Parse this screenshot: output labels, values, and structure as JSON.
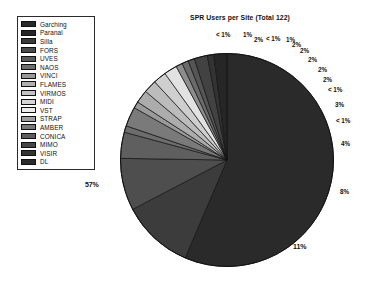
{
  "chart_data": {
    "type": "pie",
    "title": "SPR Users per Site (Total 122)",
    "total": 122,
    "legend_position": "left",
    "grid": false,
    "categories": [
      "Garching",
      "Paranal",
      "Silla",
      "FORS",
      "UVES",
      "NAOS",
      "VINCI",
      "FLAMES",
      "VIRMOS",
      "MIDI",
      "VST",
      "STRAP",
      "AMBER",
      "CONICA",
      "MIMO",
      "VISIR",
      "DL"
    ],
    "values": [
      57,
      11,
      8,
      4,
      1,
      3,
      2,
      2,
      2,
      2,
      1,
      1,
      2,
      2,
      1,
      1,
      1
    ],
    "labels": [
      "57%",
      "11%",
      "8%",
      "4%",
      "< 1%",
      "3%",
      "< 1%",
      "2%",
      "2%",
      "2%",
      "2%",
      "< 1%",
      "1%",
      "< 1%",
      "2%",
      "1%",
      "2%"
    ],
    "colors": [
      "#2a2a2a",
      "#3c3c3c",
      "#4e4e4e",
      "#5f5f5f",
      "#6d6d6d",
      "#7a7a7a",
      "#9a9a9a",
      "#acacac",
      "#bcbcbc",
      "#cfcfcf",
      "#e2e2e2",
      "#8d8d8d",
      "#6a6a6a",
      "#555555",
      "#424242",
      "#333333",
      "#262626"
    ],
    "slices": [
      {
        "name": "Garching",
        "label": "57%",
        "value": 57,
        "color": "#2a2a2a"
      },
      {
        "name": "Paranal",
        "label": "11%",
        "value": 11,
        "color": "#3c3c3c"
      },
      {
        "name": "Silla",
        "label": "8%",
        "value": 8,
        "color": "#4e4e4e"
      },
      {
        "name": "FORS",
        "label": "4%",
        "value": 4,
        "color": "#5f5f5f"
      },
      {
        "name": "UVES",
        "label": "< 1%",
        "value": 1,
        "color": "#6d6d6d"
      },
      {
        "name": "NAOS",
        "label": "3%",
        "value": 3,
        "color": "#7a7a7a"
      },
      {
        "name": "VINCI",
        "label": "< 1%",
        "value": 1,
        "color": "#9a9a9a"
      },
      {
        "name": "FLAMES",
        "label": "2%",
        "value": 2,
        "color": "#acacac"
      },
      {
        "name": "VIRMOS",
        "label": "2%",
        "value": 2,
        "color": "#bcbcbc"
      },
      {
        "name": "MIDI",
        "label": "2%",
        "value": 2,
        "color": "#cfcfcf"
      },
      {
        "name": "VST",
        "label": "2%",
        "value": 2,
        "color": "#e2e2e2"
      },
      {
        "name": "STRAP",
        "label": "< 1%",
        "value": 1,
        "color": "#8d8d8d"
      },
      {
        "name": "AMBER",
        "label": "1%",
        "value": 1,
        "color": "#6a6a6a"
      },
      {
        "name": "CONICA",
        "label": "< 1%",
        "value": 1,
        "color": "#555555"
      },
      {
        "name": "MIMO",
        "label": "2%",
        "value": 2,
        "color": "#424242"
      },
      {
        "name": "VISIR",
        "label": "1%",
        "value": 1,
        "color": "#333333"
      },
      {
        "name": "DL",
        "label": "2%",
        "value": 2,
        "color": "#262626"
      }
    ]
  },
  "legend": {
    "items": [
      {
        "label": "Garching",
        "color": "#2a2a2a"
      },
      {
        "label": "Paranal",
        "color": "#262626"
      },
      {
        "label": "Silla",
        "color": "#3a3a3a"
      },
      {
        "label": "FORS",
        "color": "#4a4a4a"
      },
      {
        "label": "UVES",
        "color": "#5a5a5a"
      },
      {
        "label": "NAOS",
        "color": "#6e6e6e"
      },
      {
        "label": "VINCI",
        "color": "#9a9a9a"
      },
      {
        "label": "FLAMES",
        "color": "#b0b0b0"
      },
      {
        "label": "VIRMOS",
        "color": "#c2c2c2"
      },
      {
        "label": "MIDI",
        "color": "#d6d6d6"
      },
      {
        "label": "VST",
        "color": "#ececec"
      },
      {
        "label": "STRAP",
        "color": "#9c9c9c"
      },
      {
        "label": "AMBER",
        "color": "#787878"
      },
      {
        "label": "CONICA",
        "color": "#5e5e5e"
      },
      {
        "label": "MIMO",
        "color": "#464646"
      },
      {
        "label": "VISIR",
        "color": "#343434"
      },
      {
        "label": "DL",
        "color": "#2a2a2a"
      }
    ]
  },
  "callouts": [
    {
      "text": "< 1%",
      "x": 216,
      "y": 31
    },
    {
      "text": "1%",
      "x": 243,
      "y": 31
    },
    {
      "text": "2%",
      "x": 254,
      "y": 36
    },
    {
      "text": "< 1%",
      "x": 266,
      "y": 35
    },
    {
      "text": "1%",
      "x": 286,
      "y": 36
    },
    {
      "text": "2%",
      "x": 292,
      "y": 41
    },
    {
      "text": "2%",
      "x": 300,
      "y": 47
    },
    {
      "text": "2%",
      "x": 308,
      "y": 56
    },
    {
      "text": "2%",
      "x": 318,
      "y": 66
    },
    {
      "text": "2%",
      "x": 323,
      "y": 76
    },
    {
      "text": "< 1%",
      "x": 328,
      "y": 86
    },
    {
      "text": "3%",
      "x": 335,
      "y": 101
    },
    {
      "text": "< 1%",
      "x": 336,
      "y": 117
    },
    {
      "text": "4%",
      "x": 341,
      "y": 140
    },
    {
      "text": "8%",
      "x": 340,
      "y": 188
    },
    {
      "text": "11%",
      "x": 293,
      "y": 243
    },
    {
      "text": "57%",
      "x": 85,
      "y": 181
    }
  ]
}
